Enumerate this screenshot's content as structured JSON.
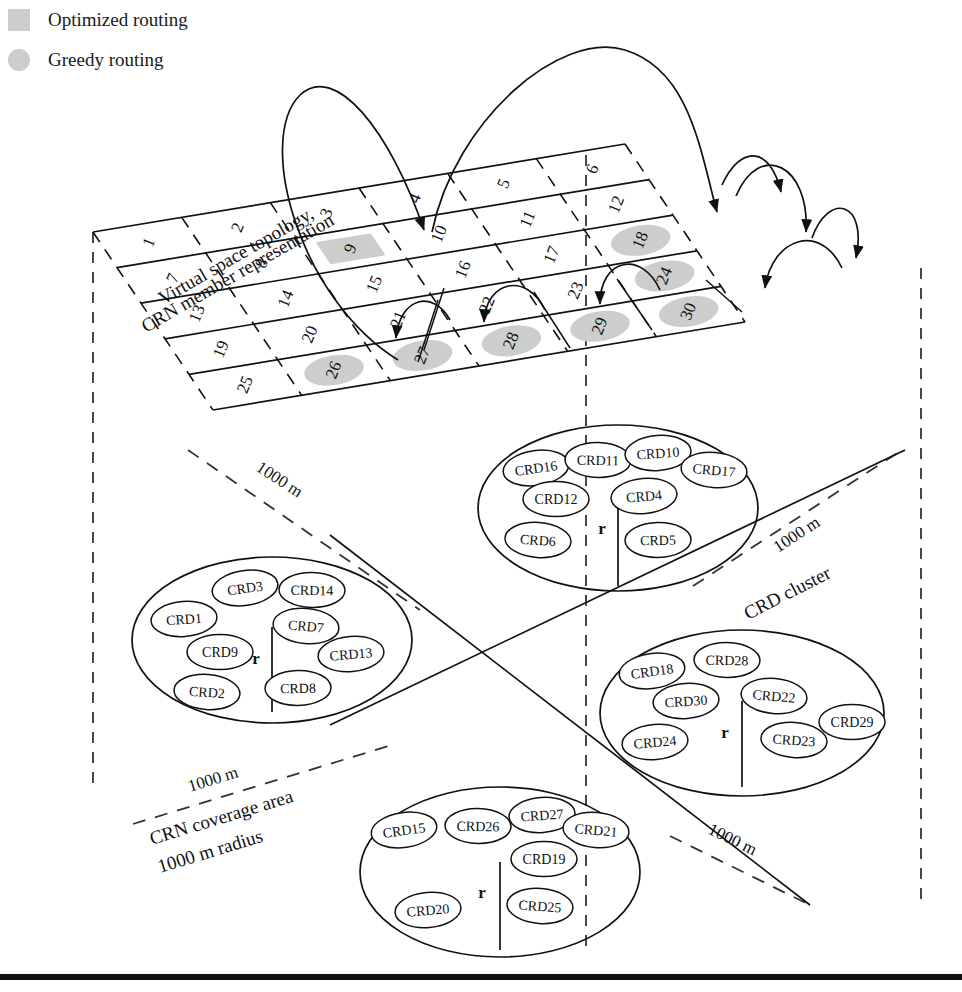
{
  "legend": {
    "items": [
      {
        "name": "optimized",
        "label": "Optimized routing",
        "shape": "square",
        "color": "#cdcdcd"
      },
      {
        "name": "greedy",
        "label": "Greedy routing",
        "shape": "circle",
        "color": "#cdcdcd"
      }
    ]
  },
  "captions": {
    "virtual_space_line1": "Virtual space topology,",
    "virtual_space_line2": "CRN member representation",
    "crn_coverage_line1": "CRN coverage area",
    "crn_coverage_line2": "1000 m radius",
    "crd_cluster": "CRD cluster",
    "dim_top_left": "1000 m",
    "dim_top_right": "1000 m",
    "dim_bottom_left": "1000 m",
    "dim_bottom_right": "1000 m",
    "radius_marker": "r"
  },
  "grid": {
    "rows": 5,
    "cols": 6,
    "cells": [
      "1",
      "2",
      "3",
      "4",
      "5",
      "6",
      "7",
      "8",
      "9",
      "10",
      "11",
      "12",
      "13",
      "14",
      "15",
      "16",
      "17",
      "18",
      "19",
      "20",
      "21",
      "22",
      "23",
      "24",
      "25",
      "26",
      "27",
      "28",
      "29",
      "30"
    ],
    "optimized_highlight": [
      "9"
    ],
    "greedy_highlight": [
      "18",
      "24",
      "30",
      "29",
      "28",
      "27",
      "26"
    ]
  },
  "routing": {
    "optimized_path": [
      "25",
      "9",
      "12"
    ],
    "greedy_path": [
      "18",
      "24",
      "30",
      "29",
      "28",
      "27",
      "26"
    ]
  },
  "clusters": [
    {
      "name": "cluster-top",
      "members": [
        "CRD16",
        "CRD11",
        "CRD10",
        "CRD17",
        "CRD12",
        "CRD4",
        "CRD6",
        "CRD5"
      ],
      "radius_label": "r"
    },
    {
      "name": "cluster-left",
      "members": [
        "CRD3",
        "CRD14",
        "CRD1",
        "CRD7",
        "CRD9",
        "CRD13",
        "CRD2",
        "CRD8"
      ],
      "radius_label": "r"
    },
    {
      "name": "cluster-right",
      "members": [
        "CRD18",
        "CRD28",
        "CRD30",
        "CRD22",
        "CRD29",
        "CRD24",
        "CRD23"
      ],
      "radius_label": "r"
    },
    {
      "name": "cluster-bottom",
      "members": [
        "CRD15",
        "CRD26",
        "CRD27",
        "CRD21",
        "CRD19",
        "CRD20",
        "CRD25"
      ],
      "radius_label": "r"
    }
  ],
  "colors": {
    "line": "#111111",
    "highlight": "#cdcdcd",
    "background": "#ffffff"
  }
}
